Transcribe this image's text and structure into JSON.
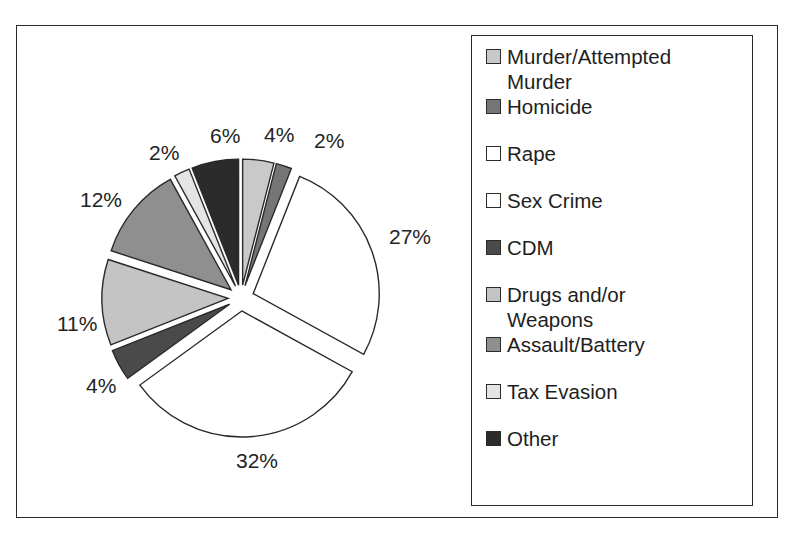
{
  "chart_data": {
    "type": "pie",
    "title": "",
    "exploded": true,
    "legend_position": "right",
    "categories": [
      "Murder/Attempted Murder",
      "Homicide",
      "Rape",
      "Sex Crime",
      "CDM",
      "Drugs and/or Weapons",
      "Assault/Battery",
      "Tax Evasion",
      "Other"
    ],
    "values": [
      4,
      2,
      27,
      32,
      4,
      11,
      12,
      2,
      6
    ],
    "value_labels": [
      "4%",
      "2%",
      "27%",
      "32%",
      "4%",
      "11%",
      "12%",
      "2%",
      "6%"
    ],
    "unit": "%",
    "colors": [
      "#c9c9c9",
      "#757575",
      "#ffffff",
      "#ffffff",
      "#4a4a4a",
      "#c4c4c4",
      "#8f8f8f",
      "#e4e4e4",
      "#2b2b2b"
    ],
    "slice_outline_color": "#2a2a2a"
  },
  "pie": {
    "slices": [
      {
        "label": "Murder/Attempted Murder",
        "value": 4,
        "display": "4%",
        "color": "#c9c9c9",
        "label_x": 247,
        "label_y": 98
      },
      {
        "label": "Homicide",
        "value": 2,
        "display": "2%",
        "color": "#757575",
        "label_x": 297,
        "label_y": 104
      },
      {
        "label": "Rape",
        "value": 27,
        "display": "27%",
        "color": "#ffffff",
        "label_x": 372,
        "label_y": 200
      },
      {
        "label": "Sex Crime",
        "value": 32,
        "display": "32%",
        "color": "#ffffff",
        "label_x": 219,
        "label_y": 424
      },
      {
        "label": "CDM",
        "value": 4,
        "display": "4%",
        "color": "#4a4a4a",
        "label_x": 69,
        "label_y": 349
      },
      {
        "label": "Drugs and/or Weapons",
        "value": 11,
        "display": "11%",
        "color": "#c4c4c4",
        "label_x": 40,
        "label_y": 287
      },
      {
        "label": "Assault/Battery",
        "value": 12,
        "display": "12%",
        "color": "#8f8f8f",
        "label_x": 63,
        "label_y": 163
      },
      {
        "label": "Tax Evasion",
        "value": 2,
        "display": "2%",
        "color": "#e4e4e4",
        "label_x": 132,
        "label_y": 116
      },
      {
        "label": "Other",
        "value": 6,
        "display": "6%",
        "color": "#2b2b2b",
        "label_x": 193,
        "label_y": 99
      }
    ]
  },
  "legend": {
    "items": [
      {
        "label": "Murder/Attempted\nMurder",
        "color": "#c9c9c9"
      },
      {
        "label": "Homicide",
        "color": "#757575"
      },
      {
        "label": "Rape",
        "color": "#ffffff"
      },
      {
        "label": "Sex Crime",
        "color": "#ffffff"
      },
      {
        "label": "CDM",
        "color": "#4a4a4a"
      },
      {
        "label": "Drugs and/or\nWeapons",
        "color": "#c4c4c4"
      },
      {
        "label": "Assault/Battery",
        "color": "#8f8f8f"
      },
      {
        "label": "Tax Evasion",
        "color": "#e4e4e4"
      },
      {
        "label": "Other",
        "color": "#2b2b2b"
      }
    ]
  }
}
